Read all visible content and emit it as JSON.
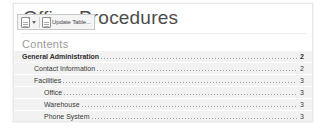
{
  "document": {
    "title": "Office Procedures",
    "contents_heading": "Contents"
  },
  "toolbar": {
    "doc_icon": "document-icon",
    "dropdown_icon": "chevron-down-icon",
    "table_icon": "table-icon",
    "update_label": "Update Table..."
  },
  "toc": {
    "entries": [
      {
        "text": "General Administration",
        "page": "2",
        "level": 1
      },
      {
        "text": "Contact Information",
        "page": "2",
        "level": 2
      },
      {
        "text": "Facilities",
        "page": "3",
        "level": 2
      },
      {
        "text": "Office",
        "page": "3",
        "level": 3
      },
      {
        "text": "Warehouse",
        "page": "3",
        "level": 3
      },
      {
        "text": "Phone System",
        "page": "3",
        "level": 3
      }
    ]
  },
  "colors": {
    "field_shading": "#f2f2f2",
    "panel_border": "#e8e8e8",
    "toolbar_bg": "#f4f4f4",
    "toolbar_border": "#c8c8c8",
    "heading_text": "#9a9a9a",
    "body_text": "#3a3a3a"
  }
}
